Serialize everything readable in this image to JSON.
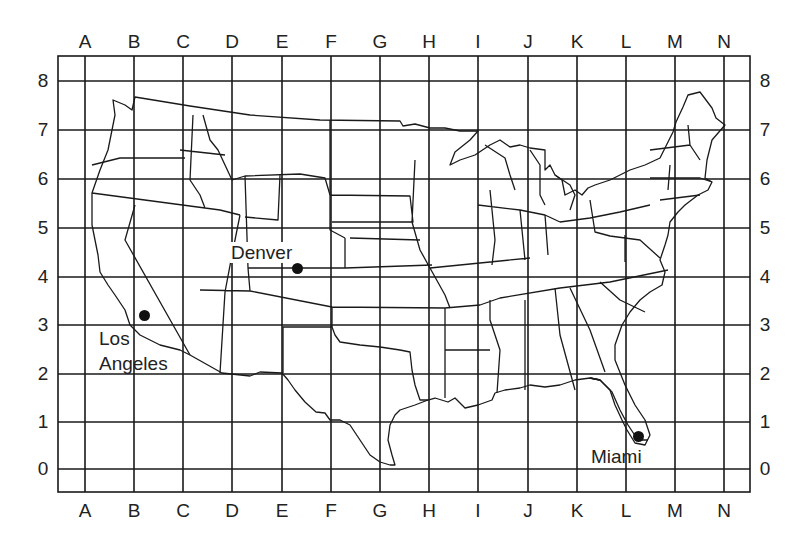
{
  "map": {
    "title": "",
    "grid": {
      "columns": [
        "A",
        "B",
        "C",
        "D",
        "E",
        "F",
        "G",
        "H",
        "I",
        "J",
        "K",
        "L",
        "M",
        "N"
      ],
      "rows": [
        "8",
        "7",
        "6",
        "5",
        "4",
        "3",
        "2",
        "1",
        "0"
      ],
      "column_x": [
        85,
        134,
        183,
        232,
        282,
        331,
        380,
        429,
        478,
        528,
        577,
        626,
        675,
        724
      ],
      "row_y": [
        81,
        130,
        179,
        228,
        277,
        325,
        374,
        422,
        469
      ],
      "frame": {
        "left": 58,
        "top": 56,
        "right": 750,
        "bottom": 492
      },
      "line_color": "#1a1a1a"
    },
    "cities": [
      {
        "name": "Denver",
        "label_lines": [
          "Denver"
        ],
        "grid_ref": "E,4",
        "dot": {
          "x": 297,
          "y": 268
        },
        "label": {
          "x": 230,
          "y": 242
        }
      },
      {
        "name": "Los Angeles",
        "label_lines": [
          "Los",
          "Angeles"
        ],
        "grid_ref": "B,3",
        "dot": {
          "x": 144,
          "y": 315
        },
        "label": {
          "x": 99,
          "y": 328
        }
      },
      {
        "name": "Miami",
        "label_lines": [
          "Miami"
        ],
        "grid_ref": "L,1",
        "dot": {
          "x": 638,
          "y": 436
        },
        "label": {
          "x": 591,
          "y": 446
        }
      }
    ]
  },
  "labels": {
    "top": [
      "A",
      "B",
      "C",
      "D",
      "E",
      "F",
      "G",
      "H",
      "I",
      "J",
      "K",
      "L",
      "M",
      "N"
    ],
    "bottom": [
      "A",
      "B",
      "C",
      "D",
      "E",
      "F",
      "G",
      "H",
      "I",
      "J",
      "K",
      "L",
      "M",
      "N"
    ],
    "left": [
      "8",
      "7",
      "6",
      "5",
      "4",
      "3",
      "2",
      "1",
      "0"
    ],
    "right": [
      "8",
      "7",
      "6",
      "5",
      "4",
      "3",
      "2",
      "1",
      "0"
    ]
  },
  "cities_text": {
    "denver": "Denver",
    "los": "Los",
    "angeles": "Angeles",
    "miami": "Miami"
  }
}
